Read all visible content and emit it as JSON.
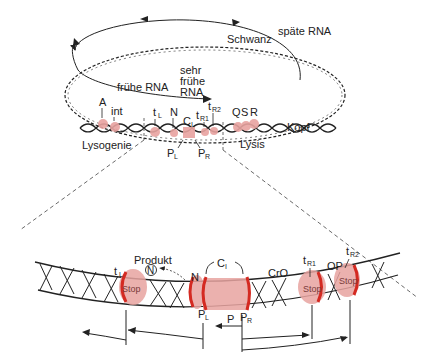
{
  "top_diagram": {
    "rna_labels": {
      "late": "späte RNA",
      "early": "frühe RNA",
      "very_early_line1": "sehr",
      "very_early_line2": "frühe",
      "very_early_line3": "RNA"
    },
    "region_labels": {
      "tail": "Schwanz",
      "head": "Kopf",
      "lysogeny": "Lysogenie",
      "lysis": "Lysis"
    },
    "genes": {
      "A": "A",
      "int": "int",
      "tL": "t",
      "tL_sub": "L",
      "N": "N",
      "CI": "C",
      "CI_sub": "I",
      "tR1": "t",
      "tR1_sub": "R1",
      "tR2": "t",
      "tR2_sub": "R2",
      "Q": "Q",
      "S": "S",
      "R": "R"
    },
    "promoters": {
      "PL": "P",
      "PL_sub": "L",
      "PR": "P",
      "PR_sub": "R"
    }
  },
  "bottom_diagram": {
    "product_label": "Produkt",
    "product_symbol": "N",
    "CI": "C",
    "CI_sub": "I",
    "N": "N",
    "CrO": "CrO",
    "OP": "OP",
    "tL": "t",
    "tL_sub": "L",
    "tR1": "t",
    "tR1_sub": "R1",
    "tR2": "t",
    "tR2_sub": "R2",
    "stop_label": "Stop",
    "PL": "P",
    "PL_sub": "L",
    "P": "P",
    "PR": "P",
    "PR_sub": "R"
  },
  "colors": {
    "highlight_fill": "#e8a3a0",
    "highlight_edge": "#d42a22",
    "line": "#222222"
  }
}
